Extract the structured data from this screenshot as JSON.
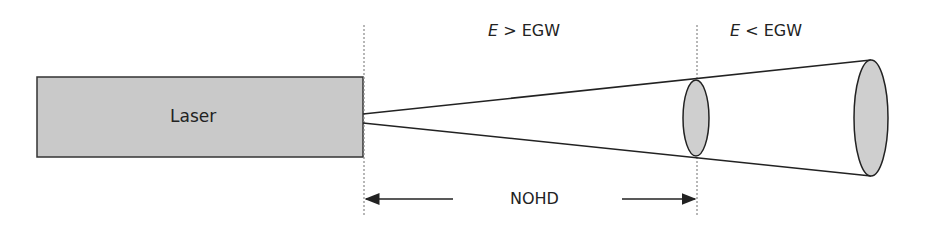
{
  "laser": {
    "label": "Laser",
    "fill": "#c9c9c9"
  },
  "regions": {
    "near": {
      "var": "E",
      "op": ">",
      "ref": "EGW"
    },
    "far": {
      "var": "E",
      "op": "<",
      "ref": "EGW"
    }
  },
  "distance": {
    "label": "NOHD"
  },
  "colors": {
    "stroke": "#222222",
    "beam_fill": "#cfcfcf",
    "dotted": "#888888"
  }
}
